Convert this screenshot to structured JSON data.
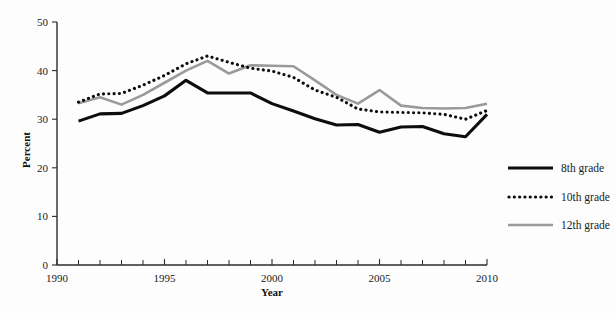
{
  "chart_data": {
    "type": "line",
    "title": "",
    "xlabel": "Year",
    "ylabel": "Percent",
    "xlim": [
      1990,
      2010
    ],
    "ylim": [
      0,
      50
    ],
    "yticks": [
      0,
      10,
      20,
      30,
      40,
      50
    ],
    "ytick_labels": [
      "0",
      "10",
      "20",
      "30",
      "40",
      "50"
    ],
    "xticks": [
      1990,
      1995,
      2000,
      2005,
      2010
    ],
    "xtick_labels": [
      "1990",
      "1995",
      "2000",
      "2005",
      "2010"
    ],
    "x_minor_tick_interval": 1,
    "grid": false,
    "legend_position": "right",
    "x": [
      1991,
      1992,
      1993,
      1994,
      1995,
      1996,
      1997,
      1998,
      1999,
      2000,
      2001,
      2002,
      2003,
      2004,
      2005,
      2006,
      2007,
      2008,
      2009,
      2010
    ],
    "series": [
      {
        "name": "8th grade",
        "style": "solid",
        "color": "#0d0d0d",
        "values": [
          29.6,
          31.1,
          31.2,
          32.8,
          34.8,
          38.0,
          35.4,
          35.4,
          35.4,
          33.2,
          31.7,
          30.1,
          28.8,
          28.9,
          27.3,
          28.4,
          28.5,
          27.0,
          26.4,
          31.0
        ]
      },
      {
        "name": "10th grade",
        "style": "dotted",
        "color": "#0d0d0d",
        "values": [
          33.5,
          35.2,
          35.3,
          37.0,
          39.0,
          41.4,
          43.0,
          41.7,
          40.5,
          39.9,
          38.6,
          36.0,
          34.5,
          32.1,
          31.5,
          31.4,
          31.3,
          31.0,
          30.0,
          31.8
        ]
      },
      {
        "name": "12th grade",
        "style": "solid",
        "color": "#9a9a9a",
        "values": [
          33.3,
          34.5,
          33.0,
          35.0,
          37.5,
          40.0,
          42.0,
          39.4,
          41.1,
          41.0,
          40.9,
          38.0,
          35.0,
          33.2,
          36.0,
          32.8,
          32.3,
          32.2,
          32.3,
          33.2
        ]
      }
    ]
  },
  "legend": {
    "items": [
      {
        "label": "8th grade"
      },
      {
        "label": "10th grade"
      },
      {
        "label": "12th grade"
      }
    ]
  },
  "axes": {
    "y_title": "Percent",
    "x_title": "Year"
  },
  "colors": {
    "background": "#fdfdfd",
    "axis": "#2b2b2b",
    "dark_series": "#0d0d0d",
    "gray_series": "#9a9a9a"
  }
}
